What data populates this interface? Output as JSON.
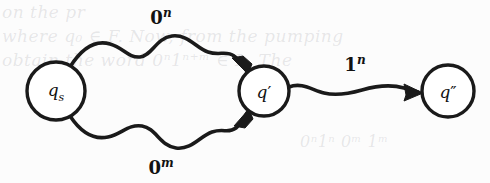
{
  "figure": {
    "kind": "state-transition-diagram",
    "ink_color": "#1a1a1a",
    "background_color": "#fcfcfc",
    "states": [
      {
        "id": "q_s",
        "base": "q",
        "sub": "s",
        "prime": "",
        "cx": 56,
        "cy": 91,
        "r": 29
      },
      {
        "id": "q_prime",
        "base": "q",
        "sub": "",
        "prime": "′",
        "cx": 264,
        "cy": 91,
        "r": 25
      },
      {
        "id": "q_dprime",
        "base": "q",
        "sub": "",
        "prime": "″",
        "cx": 448,
        "cy": 91,
        "r": 26
      }
    ],
    "edges": [
      {
        "id": "edge-top",
        "from": "q_s",
        "to": "q_prime",
        "symbol": "0",
        "exponent": "n",
        "label_x": 161,
        "label_y": 17
      },
      {
        "id": "edge-bottom",
        "from": "q_s",
        "to": "q_prime",
        "symbol": "0",
        "exponent": "m",
        "label_x": 161,
        "label_y": 167
      },
      {
        "id": "edge-right",
        "from": "q_prime",
        "to": "q_dprime",
        "symbol": "1",
        "exponent": "n",
        "label_x": 355,
        "label_y": 64
      }
    ]
  },
  "bleed_text": {
    "line1": "on the pr",
    "line2": "where q₀ ∈ F. Now, from the pumping",
    "line3": "obtain the word 0ⁿ1ⁿ⁺ᵐ ∈ L. The",
    "line4": "0ⁿ1ⁿ 0ᵐ 1ᵐ"
  }
}
